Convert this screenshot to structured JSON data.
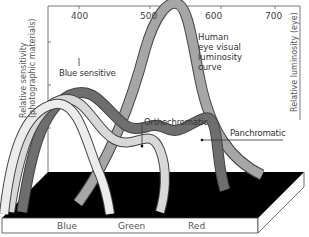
{
  "wavelength_ticks": [
    "400",
    "500",
    "600",
    "700"
  ],
  "axes": {
    "left_label_line1": "Relative sensitivity",
    "left_label_line2": "(photographic materials)",
    "right_label": "Relative luminosity (eye)"
  },
  "curves": {
    "blue_sensitive": "Blue sensitive",
    "orthochromatic": "Orthochromatic",
    "panchromatic": "Panchromatic",
    "human_eye": "Human\neye visual\nluminosity\ncurve"
  },
  "base_labels": [
    "Blue",
    "Green",
    "Red"
  ],
  "colors": {
    "background": "#ffffff",
    "base_top": "#000000",
    "base_front": "#ffffff",
    "panchromatic_ribbon": "#6e6e6e",
    "human_eye_ribbon": "#a6a6a6",
    "blue_sensitive_ribbon": "#e8e8e8",
    "orthochromatic_ribbon": "#d8d8d8",
    "outline": "#444444"
  }
}
